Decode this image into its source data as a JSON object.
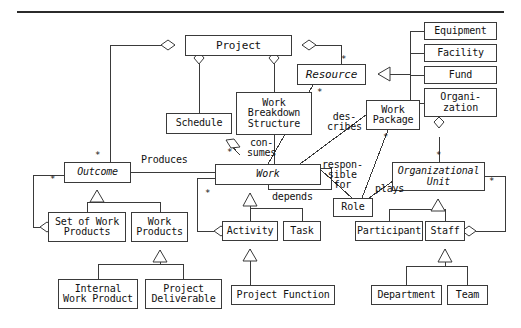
{
  "diagram": {
    "kind": "uml-class-diagram",
    "canvas": {
      "width": 521,
      "height": 328
    },
    "stroke_color": "#3a3a3a",
    "text_color": "#111111",
    "background": "#ffffff",
    "rule": {
      "visible": true,
      "color": "#2b2b2b"
    },
    "classes": [
      {
        "id": "project",
        "label": "Project",
        "abstract": false,
        "x": 185,
        "y": 35,
        "w": 107,
        "h": 21,
        "font": 11
      },
      {
        "id": "resource",
        "label": "Resource",
        "abstract": true,
        "x": 297,
        "y": 64,
        "w": 69,
        "h": 21,
        "font": 11
      },
      {
        "id": "equipment",
        "label": "Equipment",
        "abstract": false,
        "x": 424,
        "y": 22,
        "w": 73,
        "h": 18,
        "font": 10
      },
      {
        "id": "facility",
        "label": "Facility",
        "abstract": false,
        "x": 424,
        "y": 44,
        "w": 73,
        "h": 18,
        "font": 10
      },
      {
        "id": "fund",
        "label": "Fund",
        "abstract": false,
        "x": 424,
        "y": 66,
        "w": 73,
        "h": 18,
        "font": 10
      },
      {
        "id": "organization",
        "label": "Organi-\nzation",
        "abstract": false,
        "x": 424,
        "y": 88,
        "w": 73,
        "h": 29,
        "font": 10
      },
      {
        "id": "schedule",
        "label": "Schedule",
        "abstract": false,
        "x": 166,
        "y": 113,
        "w": 66,
        "h": 21,
        "font": 10
      },
      {
        "id": "wbs",
        "label": "Work\nBreakdown\nStructure",
        "abstract": false,
        "x": 236,
        "y": 92,
        "w": 76,
        "h": 43,
        "font": 10
      },
      {
        "id": "work-package",
        "label": "Work\nPackage",
        "abstract": false,
        "x": 366,
        "y": 100,
        "w": 54,
        "h": 30,
        "font": 10
      },
      {
        "id": "org-unit",
        "label": "Organizational\nUnit",
        "abstract": true,
        "x": 392,
        "y": 162,
        "w": 93,
        "h": 29,
        "font": 10
      },
      {
        "id": "outcome",
        "label": "Outcome",
        "abstract": true,
        "x": 64,
        "y": 162,
        "w": 67,
        "h": 21,
        "font": 10
      },
      {
        "id": "work",
        "label": "Work",
        "abstract": true,
        "x": 215,
        "y": 164,
        "w": 106,
        "h": 21,
        "font": 10
      },
      {
        "id": "role",
        "label": "Role",
        "abstract": false,
        "x": 333,
        "y": 198,
        "w": 40,
        "h": 19,
        "font": 10
      },
      {
        "id": "set-of-work-products",
        "label": "Set of Work\nProducts",
        "abstract": false,
        "x": 48,
        "y": 212,
        "w": 78,
        "h": 30,
        "font": 10
      },
      {
        "id": "work-products",
        "label": "Work\nProducts",
        "abstract": false,
        "x": 131,
        "y": 212,
        "w": 57,
        "h": 30,
        "font": 10
      },
      {
        "id": "activity",
        "label": "Activity",
        "abstract": false,
        "x": 222,
        "y": 221,
        "w": 56,
        "h": 20,
        "font": 10
      },
      {
        "id": "task",
        "label": "Task",
        "abstract": false,
        "x": 283,
        "y": 221,
        "w": 38,
        "h": 20,
        "font": 10
      },
      {
        "id": "participant",
        "label": "Participant",
        "abstract": false,
        "x": 355,
        "y": 221,
        "w": 68,
        "h": 20,
        "font": 10
      },
      {
        "id": "staff",
        "label": "Staff",
        "abstract": false,
        "x": 425,
        "y": 221,
        "w": 40,
        "h": 20,
        "font": 10
      },
      {
        "id": "internal-work-product",
        "label": "Internal\nWork Product",
        "abstract": false,
        "x": 58,
        "y": 279,
        "w": 80,
        "h": 30,
        "font": 10
      },
      {
        "id": "project-deliverable",
        "label": "Project\nDeliverable",
        "abstract": false,
        "x": 145,
        "y": 279,
        "w": 77,
        "h": 30,
        "font": 10
      },
      {
        "id": "project-function",
        "label": "Project Function",
        "abstract": false,
        "x": 231,
        "y": 285,
        "w": 104,
        "h": 20,
        "font": 10
      },
      {
        "id": "department",
        "label": "Department",
        "abstract": false,
        "x": 371,
        "y": 285,
        "w": 71,
        "h": 20,
        "font": 10
      },
      {
        "id": "team",
        "label": "Team",
        "abstract": false,
        "x": 447,
        "y": 285,
        "w": 41,
        "h": 20,
        "font": 10
      }
    ],
    "edge_labels": [
      {
        "id": "describes",
        "text": "des-\ncribes",
        "x": 327,
        "y": 112,
        "font": 10
      },
      {
        "id": "consumes",
        "text": "con-\nsumes",
        "x": 247,
        "y": 138,
        "font": 10
      },
      {
        "id": "produces",
        "text": "Produces",
        "x": 141,
        "y": 155,
        "font": 10
      },
      {
        "id": "responsible-for",
        "text": "respon-\nsible\nfor",
        "x": 322,
        "y": 160,
        "font": 10
      },
      {
        "id": "depends",
        "text": "depends",
        "x": 272,
        "y": 192,
        "font": 10
      },
      {
        "id": "plays",
        "text": "plays",
        "x": 375,
        "y": 184,
        "font": 10
      }
    ],
    "multiplicities": [
      {
        "id": "mult-project-resource",
        "text": "*",
        "x": 341,
        "y": 55
      },
      {
        "id": "mult-resource-work",
        "text": "*",
        "x": 317,
        "y": 88
      },
      {
        "id": "mult-wp-role",
        "text": "*",
        "x": 383,
        "y": 133
      },
      {
        "id": "mult-wbs-work",
        "text": "*",
        "x": 227,
        "y": 148
      },
      {
        "id": "mult-project-outcome",
        "text": "*",
        "x": 95,
        "y": 151
      },
      {
        "id": "mult-outcome-setwp",
        "text": "*",
        "x": 50,
        "y": 175
      },
      {
        "id": "mult-work-activity",
        "text": "*",
        "x": 205,
        "y": 189
      },
      {
        "id": "mult-orgunit-top",
        "text": "*",
        "x": 436,
        "y": 151
      },
      {
        "id": "mult-orgunit-staff",
        "text": "*",
        "x": 489,
        "y": 177
      }
    ],
    "relations": [
      {
        "id": "project-outcome",
        "type": "aggregation",
        "from": "project",
        "to": "outcome"
      },
      {
        "id": "project-schedule",
        "type": "aggregation",
        "from": "project",
        "to": "schedule"
      },
      {
        "id": "project-wbs",
        "type": "aggregation",
        "from": "project",
        "to": "wbs"
      },
      {
        "id": "project-resource",
        "type": "aggregation",
        "from": "project",
        "to": "resource"
      },
      {
        "id": "resource-equipment",
        "type": "generalization",
        "from": "equipment",
        "to": "resource"
      },
      {
        "id": "resource-facility",
        "type": "generalization",
        "from": "facility",
        "to": "resource"
      },
      {
        "id": "resource-fund",
        "type": "generalization",
        "from": "fund",
        "to": "resource"
      },
      {
        "id": "resource-organization",
        "type": "generalization",
        "from": "organization",
        "to": "resource"
      },
      {
        "id": "organization-orgunit",
        "type": "aggregation",
        "from": "organization",
        "to": "org-unit"
      },
      {
        "id": "schedule-work",
        "type": "aggregation",
        "from": "schedule",
        "to": "work"
      },
      {
        "id": "wbs-work",
        "type": "association",
        "from": "wbs",
        "to": "work",
        "label": "consumes"
      },
      {
        "id": "resource-work",
        "type": "association",
        "from": "resource",
        "to": "work"
      },
      {
        "id": "wp-describes-work",
        "type": "association",
        "from": "work-package",
        "to": "work",
        "label": "describes"
      },
      {
        "id": "outcome-work",
        "type": "association",
        "from": "outcome",
        "to": "work",
        "label": "Produces"
      },
      {
        "id": "work-role",
        "type": "association",
        "from": "work",
        "to": "role",
        "label": "responsible for"
      },
      {
        "id": "wp-role",
        "type": "association",
        "from": "work-package",
        "to": "role"
      },
      {
        "id": "role-orgunit",
        "type": "association",
        "from": "role",
        "to": "org-unit",
        "label": "plays"
      },
      {
        "id": "work-depends",
        "type": "self-association",
        "from": "work",
        "to": "work",
        "label": "depends"
      },
      {
        "id": "outcome-setwp",
        "type": "aggregation",
        "from": "outcome",
        "to": "set-of-work-products"
      },
      {
        "id": "work-activity",
        "type": "aggregation",
        "from": "work",
        "to": "activity"
      },
      {
        "id": "outcome-gen-setwp",
        "type": "generalization",
        "from": "set-of-work-products",
        "to": "outcome"
      },
      {
        "id": "outcome-gen-wp",
        "type": "generalization",
        "from": "work-products",
        "to": "outcome"
      },
      {
        "id": "wp-gen-internal",
        "type": "generalization",
        "from": "internal-work-product",
        "to": "work-products"
      },
      {
        "id": "wp-gen-deliverable",
        "type": "generalization",
        "from": "project-deliverable",
        "to": "work-products"
      },
      {
        "id": "work-gen-activity",
        "type": "generalization",
        "from": "activity",
        "to": "work"
      },
      {
        "id": "work-gen-task",
        "type": "generalization",
        "from": "task",
        "to": "work"
      },
      {
        "id": "activity-gen-pf",
        "type": "generalization",
        "from": "project-function",
        "to": "activity"
      },
      {
        "id": "orgunit-gen-participant",
        "type": "generalization",
        "from": "participant",
        "to": "org-unit"
      },
      {
        "id": "orgunit-gen-staff",
        "type": "generalization",
        "from": "staff",
        "to": "org-unit"
      },
      {
        "id": "staff-gen-department",
        "type": "generalization",
        "from": "department",
        "to": "staff"
      },
      {
        "id": "staff-gen-team",
        "type": "generalization",
        "from": "team",
        "to": "staff"
      },
      {
        "id": "staff-orgunit-agg",
        "type": "aggregation",
        "from": "staff",
        "to": "org-unit"
      }
    ]
  }
}
